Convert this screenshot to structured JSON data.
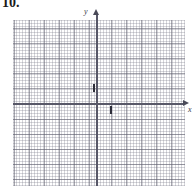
{
  "problem": {
    "number_label": "10."
  },
  "graph": {
    "x_axis_label": "x",
    "y_axis_label": "y",
    "axis_color": "#585868",
    "major_grid_color": "#5f5f6e",
    "minor_grid_color": "#7878 87",
    "tick_color": "#2e2e3a",
    "background_color": "#ffffff"
  },
  "chart_data": {
    "type": "scatter",
    "title": "",
    "xlabel": "x",
    "ylabel": "y",
    "x": [],
    "y": [],
    "series": [],
    "annotations": [
      "unit tick mark on positive y-axis at y = 1",
      "unit tick mark on positive x-axis at x = 1"
    ],
    "xlim": [
      -5.5,
      6.0
    ],
    "ylim": [
      -5.5,
      6.0
    ],
    "xticks": [
      1
    ],
    "yticks": [
      1
    ],
    "grid": true,
    "minor_grid": true,
    "minor_cells_per_major": 5,
    "legend": "none",
    "note": "Blank coordinate grid for student work; no data plotted."
  }
}
